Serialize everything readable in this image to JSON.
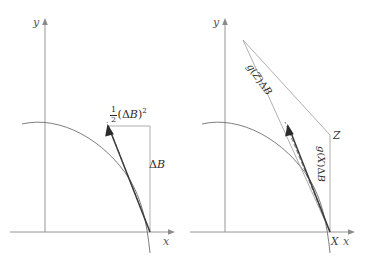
{
  "figure": {
    "background_color": "#ffffff",
    "panels": [
      {
        "id": "left",
        "axes": {
          "x_label": "x",
          "y_label": "y"
        },
        "labels": [
          {
            "name": "half-delta-b-squared",
            "text_parts": {
              "numerator": "1",
              "denominator": "2",
              "body_open": "(",
              "delta": "Δ",
              "variable": "B",
              "body_close": ")",
              "exponent": "2"
            },
            "plain": "1/2 (ΔB)^2"
          },
          {
            "name": "delta-b",
            "text_parts": {
              "delta": "Δ",
              "variable": "B"
            },
            "plain": "ΔB"
          }
        ]
      },
      {
        "id": "right",
        "axes": {
          "x_label": "x",
          "y_label": "y"
        },
        "point_labels": [
          {
            "name": "point-x",
            "text": "X"
          },
          {
            "name": "point-z",
            "text": "Z"
          }
        ],
        "labels": [
          {
            "name": "g-of-z-delta-b",
            "text_parts": {
              "function": "g",
              "open": "(",
              "argument": "Z",
              "close": ")",
              "delta": "Δ",
              "variable": "B"
            },
            "plain": "g(Z)ΔB"
          },
          {
            "name": "g-of-x-delta-b",
            "text_parts": {
              "function": "g",
              "open": "(",
              "argument": "X",
              "close": ")",
              "delta": "Δ",
              "variable": "B"
            },
            "plain": "g(X)ΔB"
          }
        ]
      }
    ],
    "colors": {
      "axis": "#8a8a8a",
      "curve": "#6f6f6f",
      "thin_line": "#9a9a9a",
      "chord": "#3a3a3a",
      "dashed": "#6f6f6f",
      "text": "#2b2b2b"
    }
  }
}
